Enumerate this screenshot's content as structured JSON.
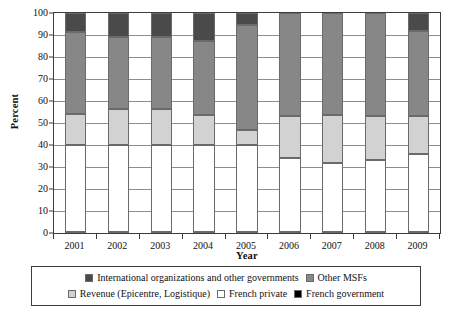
{
  "chart_data": {
    "type": "bar",
    "subtype": "stacked-percentage",
    "title": "",
    "xlabel": "Year",
    "ylabel": "Percent",
    "ylim": [
      0,
      100
    ],
    "yticks": [
      0,
      10,
      20,
      30,
      40,
      50,
      60,
      70,
      80,
      90,
      100
    ],
    "grid": true,
    "legend_position": "bottom",
    "categories": [
      "2001",
      "2002",
      "2003",
      "2004",
      "2005",
      "2006",
      "2007",
      "2008",
      "2009"
    ],
    "series": [
      {
        "name": "French government",
        "color": "#000000",
        "values": [
          0.5,
          0.5,
          0.5,
          0.5,
          0.5,
          0.5,
          0.5,
          0.5,
          0.5
        ]
      },
      {
        "name": "French private",
        "color": "#ffffff",
        "values": [
          39.5,
          39.5,
          39.5,
          39.5,
          39.5,
          33.5,
          31.5,
          32.5,
          35.5
        ]
      },
      {
        "name": "Revenue (Epicentre, Logistique)",
        "color": "#d2d2d2",
        "values": [
          14.0,
          16.5,
          16.5,
          13.5,
          7.0,
          19.0,
          21.5,
          20.0,
          17.0
        ]
      },
      {
        "name": "Other MSFs",
        "color": "#878787",
        "values": [
          37.5,
          32.5,
          32.5,
          34.0,
          47.5,
          47.0,
          46.5,
          47.0,
          39.0
        ]
      },
      {
        "name": "International organizations and other governments",
        "color": "#4a4a4a",
        "values": [
          8.5,
          11.0,
          11.0,
          12.5,
          5.5,
          0.0,
          0.0,
          0.0,
          8.0
        ]
      }
    ],
    "stack_boundaries": {
      "2001": [
        0.5,
        40.0,
        54.0,
        91.5,
        100
      ],
      "2002": [
        0.5,
        40.0,
        56.5,
        89.0,
        100
      ],
      "2003": [
        0.5,
        40.0,
        56.5,
        89.0,
        100
      ],
      "2004": [
        0.5,
        40.0,
        53.5,
        87.5,
        100
      ],
      "2005": [
        0.5,
        40.0,
        47.0,
        94.5,
        100
      ],
      "2006": [
        0.5,
        34.0,
        53.0,
        100.0,
        100
      ],
      "2007": [
        0.5,
        32.0,
        53.5,
        100.0,
        100
      ],
      "2008": [
        0.5,
        33.0,
        53.0,
        100.0,
        100
      ],
      "2009": [
        0.5,
        36.0,
        53.0,
        92.0,
        100
      ]
    }
  },
  "axes": {
    "ylabel": "Percent",
    "xlabel": "Year",
    "ytick_labels": [
      "0",
      "10",
      "20",
      "30",
      "40",
      "50",
      "60",
      "70",
      "80",
      "90",
      "100"
    ],
    "xtick_labels": [
      "2001",
      "2002",
      "2003",
      "2004",
      "2005",
      "2006",
      "2007",
      "2008",
      "2009"
    ]
  },
  "legend": {
    "row1": [
      {
        "label": "International organizations and other governments",
        "color": "#4a4a4a"
      },
      {
        "label": "Other MSFs",
        "color": "#878787"
      }
    ],
    "row2": [
      {
        "label": "Revenue (Epicentre, Logistique)",
        "color": "#d2d2d2"
      },
      {
        "label": "French private",
        "color": "#ffffff"
      },
      {
        "label": "French government",
        "color": "#000000"
      }
    ]
  },
  "colors": {
    "intl_orgs": "#4a4a4a",
    "other_msfs": "#878787",
    "revenue": "#d2d2d2",
    "french_private": "#ffffff",
    "french_government": "#000000",
    "axis": "#3d3d3d",
    "grid": "#8d8d8d"
  }
}
